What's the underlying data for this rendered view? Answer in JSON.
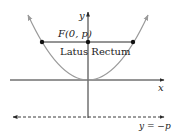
{
  "diagram": {
    "labels": {
      "y_axis": "y",
      "x_axis": "x",
      "focus": "F(0, p)",
      "latus_rectum": "Latus Rectum",
      "directrix": "y = −p"
    },
    "colors": {
      "parabola": "#9a9a9a",
      "axes": "#2a2a2a",
      "latus_rectum": "#2a2a2a",
      "points": "#111111",
      "directrix": "#3a3a3a",
      "text": "#222222"
    }
  }
}
